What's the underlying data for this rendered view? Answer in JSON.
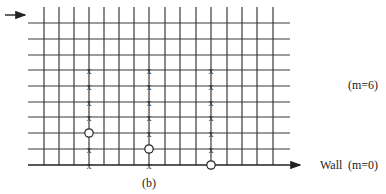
{
  "figure": {
    "caption": "(b)",
    "labels": {
      "top_row": "(m=6)",
      "wall": "Wall",
      "wall_index": "(m=0)"
    },
    "grid": {
      "h_lines_y": [
        23,
        39,
        55,
        70,
        86,
        102,
        117,
        133,
        149,
        165
      ],
      "h_x_start": 28,
      "h_x_end": 290,
      "v_lines_x": [
        44,
        59,
        74,
        89,
        104,
        119,
        134,
        149,
        165,
        180,
        196,
        211,
        227,
        242,
        257,
        273
      ],
      "v_y_start": 7,
      "v_y_end": 165,
      "line_color": "#3a3a3a"
    },
    "flow_arrow": {
      "x1": 5,
      "x2": 25,
      "y": 15
    },
    "wall_arrow": {
      "x1": 28,
      "x2": 300,
      "y": 165
    },
    "rows_y_by_m": {
      "6": 70,
      "5": 86,
      "4": 102,
      "3": 117,
      "2": 133,
      "1": 149,
      "0": 165
    },
    "columns": [
      {
        "x": 89,
        "cross_rows": [
          6,
          5,
          4,
          3,
          1,
          0
        ],
        "circle_row": 2
      },
      {
        "x": 149,
        "cross_rows": [
          6,
          5,
          4,
          3,
          2,
          0
        ],
        "circle_row": 1
      },
      {
        "x": 211,
        "cross_rows": [
          6,
          5,
          4,
          3,
          2,
          1
        ],
        "circle_row": 0
      }
    ]
  }
}
